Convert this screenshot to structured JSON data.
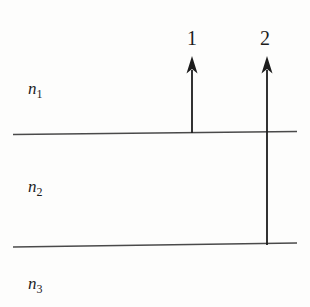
{
  "page": {
    "background": "#fdfdfc"
  },
  "diagram": {
    "type": "layered-media-refraction-diagram",
    "ink_color": "#1c1c1c",
    "interface_line_color": "#4a4a4a",
    "layers": [
      {
        "symbol": "n",
        "subscript": "1"
      },
      {
        "symbol": "n",
        "subscript": "2"
      },
      {
        "symbol": "n",
        "subscript": "3"
      }
    ],
    "interfaces": [
      {
        "name": "interface-n1-n2"
      },
      {
        "name": "interface-n2-n3"
      }
    ],
    "rays": [
      {
        "label": "1",
        "origin_interface": "n1-n2"
      },
      {
        "label": "2",
        "origin_interface": "n2-n3"
      }
    ]
  }
}
